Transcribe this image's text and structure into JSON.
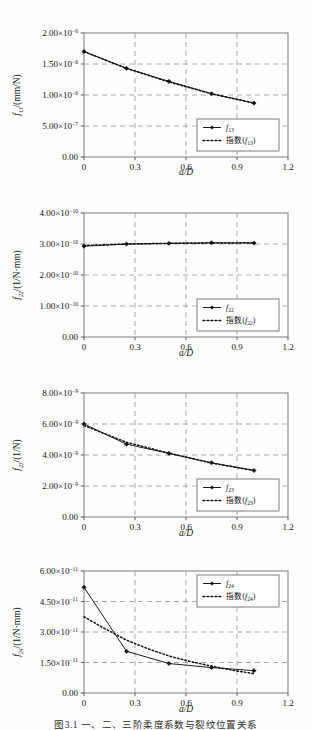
{
  "figure": {
    "caption": "图3.1 一、二、三阶柔度系数与裂纹位置关系",
    "caption_visible": "partially-cropped",
    "background": "#fefefe",
    "line_color": "#111111",
    "grid_color": "#9a9a9a"
  },
  "chart_data": [
    {
      "id": "f13",
      "type": "line",
      "title": "",
      "xlabel": "a/D",
      "ylabel": "f13/(mm/N)",
      "ylabel_parts": {
        "sym": "f",
        "sub": "13",
        "unit": "/(mm/N)"
      },
      "xlim": [
        0,
        1.2
      ],
      "ylim": [
        0,
        2e-06
      ],
      "xticks": [
        "0",
        "0.3",
        "0.6",
        "0.9",
        "1.2"
      ],
      "xtick_values": [
        0,
        0.3,
        0.6,
        0.9,
        1.2
      ],
      "yticks": [
        "0.00",
        "5.00×10⁻⁷",
        "1.00×10⁻⁶",
        "1.50×10⁻⁶",
        "2.00×10⁻⁶"
      ],
      "ytick_values": [
        0,
        5e-07,
        1e-06,
        1.5e-06,
        2e-06
      ],
      "ytick_mantissas": [
        "0.00",
        "5.00",
        "1.00",
        "1.50",
        "2.00"
      ],
      "ytick_exponents": [
        "",
        "-7",
        "-6",
        "-6",
        "-6"
      ],
      "grid": true,
      "legend_position": "bottom-right",
      "series": [
        {
          "name": "f13",
          "style": "solid-marker",
          "x": [
            0,
            0.25,
            0.5,
            0.75,
            1.0
          ],
          "values": [
            1.7e-06,
            1.43e-06,
            1.22e-06,
            1.02e-06,
            8.7e-07
          ]
        },
        {
          "name": "指数(f13)",
          "style": "dotted",
          "x": [
            0,
            0.25,
            0.5,
            0.75,
            1.0
          ],
          "values": [
            1.7e-06,
            1.43e-06,
            1.21e-06,
            1.02e-06,
            8.7e-07
          ]
        }
      ],
      "legend": [
        {
          "label": "f13",
          "sym": "f",
          "sub": "13",
          "style": "solid-marker"
        },
        {
          "label": "指数(f13)",
          "prefix": "指数(",
          "sym": "f",
          "sub": "13",
          "suffix": ")",
          "style": "dotted"
        }
      ]
    },
    {
      "id": "f22",
      "type": "line",
      "title": "",
      "xlabel": "a/D",
      "ylabel": "f22/(1/N·mm)",
      "ylabel_parts": {
        "sym": "f",
        "sub": "22",
        "unit": "/(1/N·mm)"
      },
      "xlim": [
        0,
        1.2
      ],
      "ylim": [
        0,
        4e-10
      ],
      "xticks": [
        "0",
        "0.3",
        "0.6",
        "0.9",
        "1.2"
      ],
      "xtick_values": [
        0,
        0.3,
        0.6,
        0.9,
        1.2
      ],
      "yticks": [
        "0.00",
        "1.00×10⁻¹⁰",
        "2.00×10⁻¹⁰",
        "3.00×10⁻¹⁰",
        "4.00×10⁻¹⁰"
      ],
      "ytick_values": [
        0,
        1e-10,
        2e-10,
        3e-10,
        4e-10
      ],
      "ytick_mantissas": [
        "0.00",
        "1.00",
        "2.00",
        "3.00",
        "4.00"
      ],
      "ytick_exponents": [
        "",
        "-10",
        "-10",
        "-10",
        "-10"
      ],
      "grid": true,
      "legend_position": "bottom-right",
      "series": [
        {
          "name": "f22",
          "style": "solid-marker",
          "x": [
            0,
            0.25,
            0.5,
            0.75,
            1.0
          ],
          "values": [
            2.93e-10,
            3e-10,
            3.02e-10,
            3.04e-10,
            3.03e-10
          ]
        },
        {
          "name": "指数(f22)",
          "style": "dotted",
          "x": [
            0,
            0.25,
            0.5,
            0.75,
            1.0
          ],
          "values": [
            2.95e-10,
            3e-10,
            3.02e-10,
            3.03e-10,
            3.04e-10
          ]
        }
      ],
      "legend": [
        {
          "label": "f22",
          "sym": "f",
          "sub": "22",
          "style": "solid-marker"
        },
        {
          "label": "指数(f22)",
          "prefix": "指数(",
          "sym": "f",
          "sub": "22",
          "suffix": ")",
          "style": "dotted"
        }
      ]
    },
    {
      "id": "f23",
      "type": "line",
      "title": "",
      "xlabel": "a/D",
      "ylabel": "f23/(1/N)",
      "ylabel_parts": {
        "sym": "f",
        "sub": "23",
        "unit": "/(1/N)"
      },
      "xlim": [
        0,
        1.2
      ],
      "ylim": [
        0,
        8e-09
      ],
      "xticks": [
        "0",
        "0.3",
        "0.6",
        "0.9",
        "1.2"
      ],
      "xtick_values": [
        0,
        0.3,
        0.6,
        0.9,
        1.2
      ],
      "yticks": [
        "0.00",
        "2.00×10⁻⁹",
        "4.00×10⁻⁹",
        "6.00×10⁻⁹",
        "8.00×10⁻⁹"
      ],
      "ytick_values": [
        0,
        2e-09,
        4e-09,
        6e-09,
        8e-09
      ],
      "ytick_mantissas": [
        "0.00",
        "2.00",
        "4.00",
        "6.00",
        "8.00"
      ],
      "ytick_exponents": [
        "",
        "-9",
        "-9",
        "-9",
        "-9"
      ],
      "grid": true,
      "legend_position": "bottom-right",
      "series": [
        {
          "name": "f23",
          "style": "solid-marker",
          "x": [
            0,
            0.25,
            0.5,
            0.75,
            1.0
          ],
          "values": [
            6e-09,
            4.7e-09,
            4.1e-09,
            3.5e-09,
            3e-09
          ]
        },
        {
          "name": "指数(f23)",
          "style": "dotted",
          "x": [
            0,
            0.25,
            0.5,
            0.75,
            1.0
          ],
          "values": [
            5.9e-09,
            4.82e-09,
            4.12e-09,
            3.48e-09,
            3e-09
          ]
        }
      ],
      "legend": [
        {
          "label": "f23",
          "sym": "f",
          "sub": "23",
          "style": "solid-marker"
        },
        {
          "label": "指数(f23)",
          "prefix": "指数(",
          "sym": "f",
          "sub": "23",
          "suffix": ")",
          "style": "dotted"
        }
      ]
    },
    {
      "id": "f24",
      "type": "line",
      "title": "",
      "xlabel": "a/D",
      "ylabel": "f24/(1/N·mm)",
      "ylabel_parts": {
        "sym": "f",
        "sub": "24",
        "unit": "/(1/N·mm)"
      },
      "xlim": [
        0,
        1.2
      ],
      "ylim": [
        0,
        6e-11
      ],
      "xticks": [
        "0",
        "0.3",
        "0.6",
        "0.9",
        "1.2"
      ],
      "xtick_values": [
        0,
        0.3,
        0.6,
        0.9,
        1.2
      ],
      "yticks": [
        "0.00",
        "1.50×10⁻¹¹",
        "3.00×10⁻¹¹",
        "4.50×10⁻¹¹",
        "6.00×10⁻¹¹"
      ],
      "ytick_values": [
        0,
        1.5e-11,
        3e-11,
        4.5e-11,
        6e-11
      ],
      "ytick_mantissas": [
        "0.00",
        "1.50",
        "3.00",
        "4.50",
        "6.00"
      ],
      "ytick_exponents": [
        "",
        "-11",
        "-11",
        "-11",
        "-11"
      ],
      "grid": true,
      "legend_position": "top-right",
      "series": [
        {
          "name": "f24",
          "style": "solid-marker",
          "x": [
            0,
            0.25,
            0.5,
            0.75,
            1.0
          ],
          "values": [
            5.2e-11,
            2.05e-11,
            1.45e-11,
            1.25e-11,
            1.1e-11
          ]
        },
        {
          "name": "指数(f24)",
          "style": "dotted",
          "x": [
            0,
            0.125,
            0.25,
            0.375,
            0.5,
            0.625,
            0.75,
            0.875,
            1.0
          ],
          "values": [
            3.75e-11,
            3.15e-11,
            2.6e-11,
            2.18e-11,
            1.82e-11,
            1.55e-11,
            1.32e-11,
            1.12e-11,
            9.5e-12
          ]
        }
      ],
      "legend": [
        {
          "label": "f24",
          "sym": "f",
          "sub": "24",
          "style": "solid-marker"
        },
        {
          "label": "指数(f24)",
          "prefix": "指数(",
          "sym": "f",
          "sub": "24",
          "suffix": ")",
          "style": "dotted"
        }
      ]
    }
  ]
}
